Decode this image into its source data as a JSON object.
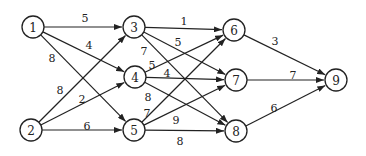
{
  "diagram": {
    "type": "directed-weighted-graph",
    "node_radius": 11,
    "nodes": [
      {
        "id": "1",
        "label": "1",
        "x": 33,
        "y": 27
      },
      {
        "id": "2",
        "label": "2",
        "x": 31,
        "y": 130
      },
      {
        "id": "3",
        "label": "3",
        "x": 134,
        "y": 27
      },
      {
        "id": "4",
        "label": "4",
        "x": 135,
        "y": 77
      },
      {
        "id": "5",
        "label": "5",
        "x": 134,
        "y": 130
      },
      {
        "id": "6",
        "label": "6",
        "x": 234,
        "y": 30
      },
      {
        "id": "7",
        "label": "7",
        "x": 236,
        "y": 80
      },
      {
        "id": "8",
        "label": "8",
        "x": 236,
        "y": 131
      },
      {
        "id": "9",
        "label": "9",
        "x": 336,
        "y": 80
      }
    ],
    "edges": [
      {
        "from": "1",
        "to": "3",
        "weight": "5",
        "lx": 85,
        "ly": 18
      },
      {
        "from": "1",
        "to": "4",
        "weight": "4",
        "lx": 89,
        "ly": 45
      },
      {
        "from": "1",
        "to": "5",
        "weight": "8",
        "lx": 52,
        "ly": 58
      },
      {
        "from": "2",
        "to": "3",
        "weight": "8",
        "lx": 60,
        "ly": 90
      },
      {
        "from": "2",
        "to": "4",
        "weight": "2",
        "lx": 82,
        "ly": 99
      },
      {
        "from": "2",
        "to": "5",
        "weight": "6",
        "lx": 87,
        "ly": 126
      },
      {
        "from": "3",
        "to": "6",
        "weight": "1",
        "lx": 184,
        "ly": 21
      },
      {
        "from": "3",
        "to": "7",
        "weight": "5",
        "lx": 178,
        "ly": 42
      },
      {
        "from": "3",
        "to": "8",
        "weight": "7",
        "lx": 144,
        "ly": 51
      },
      {
        "from": "4",
        "to": "6",
        "weight": "5",
        "lx": 152,
        "ly": 65
      },
      {
        "from": "4",
        "to": "7",
        "weight": "4",
        "lx": 167,
        "ly": 73
      },
      {
        "from": "4",
        "to": "8",
        "weight": "8",
        "lx": 148,
        "ly": 97
      },
      {
        "from": "5",
        "to": "6",
        "weight": "7",
        "lx": 147,
        "ly": 113
      },
      {
        "from": "5",
        "to": "7",
        "weight": "9",
        "lx": 176,
        "ly": 120
      },
      {
        "from": "5",
        "to": "8",
        "weight": "8",
        "lx": 180,
        "ly": 141
      },
      {
        "from": "6",
        "to": "9",
        "weight": "3",
        "lx": 275,
        "ly": 41
      },
      {
        "from": "7",
        "to": "9",
        "weight": "7",
        "lx": 293,
        "ly": 75
      },
      {
        "from": "8",
        "to": "9",
        "weight": "6",
        "lx": 274,
        "ly": 108
      }
    ]
  }
}
